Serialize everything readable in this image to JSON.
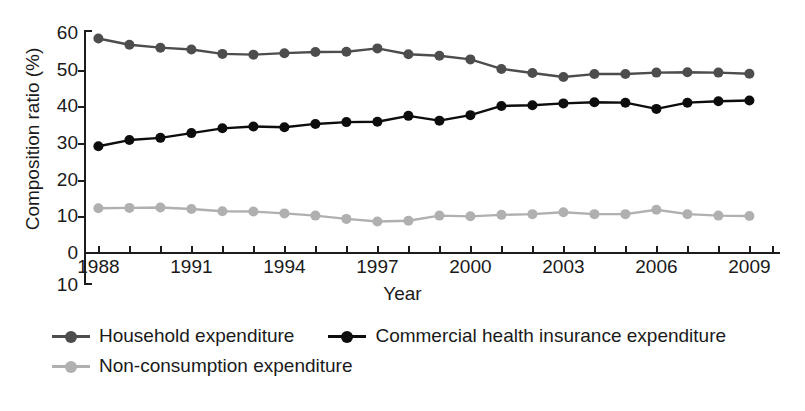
{
  "chart_data": {
    "type": "line",
    "title": "",
    "xlabel": "Year",
    "ylabel": "Composition ratio (%)",
    "xlim": [
      1987.6,
      2009.6
    ],
    "ylim": [
      0,
      60
    ],
    "grid": false,
    "legend_position": "bottom-left",
    "x": [
      1988,
      1989,
      1990,
      1991,
      1992,
      1993,
      1994,
      1995,
      1996,
      1997,
      1998,
      1999,
      2000,
      2001,
      2002,
      2003,
      2004,
      2005,
      2006,
      2007,
      2008,
      2009
    ],
    "xticks": [
      1988,
      1991,
      1994,
      1997,
      2000,
      2003,
      2006,
      2009
    ],
    "xtick_labels": [
      "1988",
      "1991",
      "1994",
      "1997",
      "2000",
      "2003",
      "2006",
      "2009"
    ],
    "yticks": [
      0,
      10,
      20,
      30,
      40,
      50,
      60
    ],
    "ytick_labels": [
      "0",
      "10",
      "20",
      "30",
      "40",
      "50",
      "60"
    ],
    "y_axis_extra_label": "10",
    "series": [
      {
        "name": "Household expenditure",
        "color": "#4d4d4d",
        "marker": "circle",
        "values": [
          58.5,
          56.8,
          56.0,
          55.5,
          54.3,
          54.1,
          54.5,
          54.8,
          54.9,
          55.8,
          54.2,
          53.8,
          52.8,
          50.2,
          49.1,
          48.0,
          48.8,
          48.8,
          49.2,
          49.3,
          49.2,
          48.9
        ]
      },
      {
        "name": "Commercial health insurance expenditure",
        "color": "#0d0d0d",
        "marker": "circle",
        "values": [
          29.1,
          30.8,
          31.4,
          32.7,
          34.0,
          34.5,
          34.3,
          35.2,
          35.7,
          35.8,
          37.4,
          36.1,
          37.6,
          40.1,
          40.3,
          40.8,
          41.1,
          41.0,
          39.3,
          41.0,
          41.4,
          41.6
        ]
      },
      {
        "name": "Non-consumption expenditure",
        "color": "#b0b0b0",
        "marker": "circle",
        "values": [
          12.2,
          12.3,
          12.4,
          12.0,
          11.4,
          11.3,
          10.8,
          10.2,
          9.3,
          8.6,
          8.8,
          10.2,
          10.0,
          10.4,
          10.6,
          11.1,
          10.6,
          10.6,
          11.8,
          10.6,
          10.2,
          10.1
        ]
      }
    ]
  },
  "legend": {
    "rows": [
      [
        {
          "label": "Household expenditure",
          "color": "#4d4d4d"
        },
        {
          "label": "Commercial health insurance expenditure",
          "color": "#0d0d0d"
        }
      ],
      [
        {
          "label": "Non-consumption expenditure",
          "color": "#b0b0b0"
        }
      ]
    ]
  }
}
